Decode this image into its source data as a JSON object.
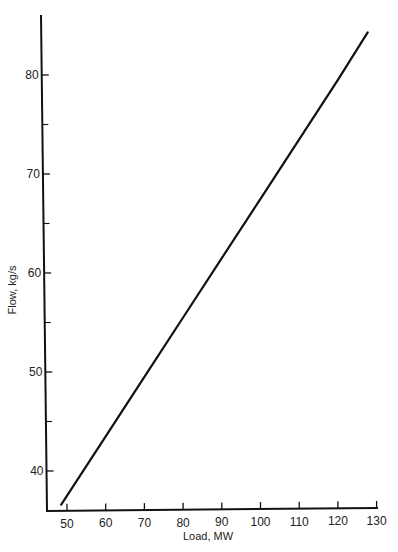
{
  "chart_data": {
    "type": "line",
    "title": "",
    "xlabel": "Load, MW",
    "ylabel": "Flow, kg/s",
    "xlim": [
      45,
      130
    ],
    "ylim": [
      36,
      86
    ],
    "grid": false,
    "legend": null,
    "x_ticks": [
      50,
      60,
      70,
      80,
      90,
      100,
      110,
      120,
      130
    ],
    "x_tick_labels": [
      "50",
      "60",
      "70",
      "80",
      "90",
      "100",
      "110",
      "120",
      "130"
    ],
    "y_ticks_major": [
      40,
      50,
      60,
      70,
      80
    ],
    "y_tick_labels": [
      "40",
      "50",
      "60",
      "70",
      "80"
    ],
    "y_ticks_minor": [
      45,
      55,
      65,
      75
    ],
    "series": [
      {
        "name": "Flow vs Load",
        "x": [
          48.5,
          60,
          70,
          80,
          90,
          100,
          110,
          120,
          127.7
        ],
        "y": [
          36.6,
          43.5,
          49.5,
          55.5,
          61.5,
          67.5,
          73.5,
          79.5,
          84.3
        ]
      }
    ]
  }
}
